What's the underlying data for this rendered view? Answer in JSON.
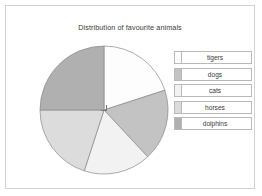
{
  "chart_data": {
    "type": "pie",
    "title": "Distribution of favourite animals",
    "categories": [
      "tigers",
      "dogs",
      "cats",
      "horses",
      "dolphins"
    ],
    "values": [
      20,
      18,
      17,
      20,
      25
    ],
    "units": "percent",
    "start_angle_deg": 0,
    "direction": "clockwise",
    "legend_position": "right",
    "grid": false,
    "annotations": [
      {
        "name": "right-angle-marker",
        "description": "small square right-angle symbol at pie centre marking the 90 degree dolphins sector"
      }
    ],
    "slices": [
      {
        "label": "tigers",
        "value": 20,
        "start_deg": 0,
        "end_deg": 72,
        "color": "#fdfdfd"
      },
      {
        "label": "dogs",
        "value": 18,
        "start_deg": 72,
        "end_deg": 137,
        "color": "#c3c3c3"
      },
      {
        "label": "cats",
        "value": 17,
        "start_deg": 137,
        "end_deg": 198,
        "color": "#f2f2f2"
      },
      {
        "label": "horses",
        "value": 20,
        "start_deg": 198,
        "end_deg": 270,
        "color": "#dcdcdc"
      },
      {
        "label": "dolphins",
        "value": 25,
        "start_deg": 270,
        "end_deg": 360,
        "color": "#b0b0b0"
      }
    ]
  },
  "legend": {
    "items": [
      {
        "label": "tigers",
        "color": "#fdfdfd"
      },
      {
        "label": "dogs",
        "color": "#c3c3c3"
      },
      {
        "label": "cats",
        "color": "#f2f2f2"
      },
      {
        "label": "horses",
        "color": "#dcdcdc"
      },
      {
        "label": "dolphins",
        "color": "#b0b0b0"
      }
    ]
  },
  "style": {
    "frame_border": "#d2d2d2",
    "slice_outline": "#8a8a8a",
    "text_color": "#3a3a3a",
    "background": "#ffffff"
  }
}
